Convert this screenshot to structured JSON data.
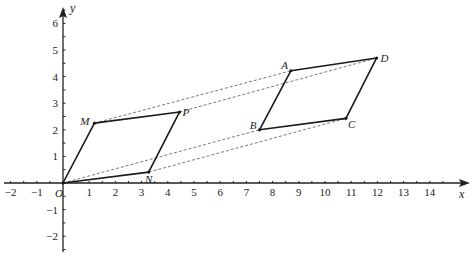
{
  "diagram": {
    "type": "coordinate-plane-translation",
    "axes": {
      "x_label": "x",
      "y_label": "y",
      "origin_label": "O",
      "x_range": [
        -2,
        14
      ],
      "y_range": [
        -2,
        6
      ],
      "x_ticks": [
        "-2",
        "-1",
        "1",
        "2",
        "3",
        "4",
        "5",
        "6",
        "7",
        "8",
        "9",
        "10",
        "11",
        "12",
        "13",
        "14"
      ],
      "y_ticks": [
        "-2",
        "-1",
        "1",
        "2",
        "3",
        "4",
        "5",
        "6"
      ]
    },
    "shapes": [
      {
        "name": "parallelogram-OMPN",
        "vertices": [
          {
            "label": "O",
            "x": 0,
            "y": 0
          },
          {
            "label": "M",
            "x": 1.2,
            "y": 2.25
          },
          {
            "label": "P",
            "x": 4.45,
            "y": 2.67
          },
          {
            "label": "N",
            "x": 3.27,
            "y": 0.41
          }
        ]
      },
      {
        "name": "parallelogram-BADC",
        "vertices": [
          {
            "label": "B",
            "x": 7.5,
            "y": 2.0
          },
          {
            "label": "A",
            "x": 8.7,
            "y": 4.22
          },
          {
            "label": "D",
            "x": 11.97,
            "y": 4.7
          },
          {
            "label": "C",
            "x": 10.8,
            "y": 2.43
          }
        ]
      }
    ],
    "translation_lines": [
      {
        "from": "O",
        "to": "B"
      },
      {
        "from": "M",
        "to": "A"
      },
      {
        "from": "P",
        "to": "D"
      },
      {
        "from": "N",
        "to": "C"
      }
    ],
    "colors": {
      "line": "#1a1a1a",
      "dashed": "#555555",
      "axis": "#222222"
    }
  }
}
